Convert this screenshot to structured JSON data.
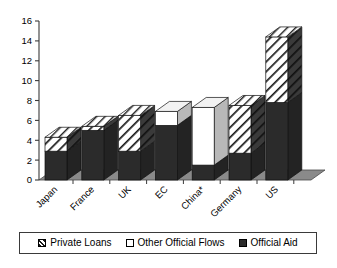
{
  "chart_data": {
    "type": "bar",
    "subtype": "stacked-bar-3d",
    "title": "",
    "subtitle": "",
    "xlabel": "",
    "ylabel": "",
    "ylim": [
      0,
      16
    ],
    "yticks": [
      0,
      2,
      4,
      6,
      8,
      10,
      12,
      14,
      16
    ],
    "ytick_labels": [
      "0",
      "2",
      "4",
      "6",
      "8",
      "10",
      "12",
      "14",
      "16"
    ],
    "grid": false,
    "legend_position": "bottom",
    "categories": [
      "Japan",
      "France",
      "UK",
      "EC",
      "China*",
      "Germany",
      "US"
    ],
    "series": [
      {
        "name": "Official Aid",
        "fill": "solid-dark",
        "color": "#2b2b2b",
        "values": [
          2.9,
          5.0,
          2.9,
          5.5,
          1.5,
          2.7,
          7.8
        ]
      },
      {
        "name": "Other Official Flows",
        "fill": "white",
        "color": "#ffffff",
        "values": [
          0.0,
          0.0,
          0.0,
          1.4,
          5.8,
          0.0,
          0.0
        ]
      },
      {
        "name": "Private Loans",
        "fill": "diagonal-hatch",
        "color": "#ffffff",
        "values": [
          1.4,
          0.4,
          3.6,
          0.0,
          0.0,
          4.8,
          6.6
        ]
      }
    ],
    "totals": [
      4.3,
      5.4,
      6.5,
      6.9,
      7.3,
      7.5,
      14.4
    ],
    "stack_order": [
      "Official Aid",
      "Other Official Flows",
      "Private Loans"
    ]
  },
  "legend": {
    "items": [
      {
        "label": "Private Loans",
        "swatch": "hatch-swatch"
      },
      {
        "label": "Other Official Flows",
        "swatch": "white-swatch"
      },
      {
        "label": "Official Aid",
        "swatch": "dark-swatch"
      }
    ]
  },
  "colors": {
    "bar_dark": "#2b2b2b",
    "bar_side_dark": "#232323",
    "bar_white": "#ffffff",
    "bar_side_white": "#b8b8b8",
    "hatch_line": "#1a1a1a",
    "floor": "#8a8a8a",
    "floor_edge": "#4a4a4a",
    "axis": "#3a3a3a",
    "text": "#000000",
    "background": "#ffffff"
  }
}
